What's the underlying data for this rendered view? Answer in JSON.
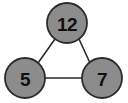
{
  "figure": {
    "background_color": "#ffffff",
    "width": 128,
    "height": 103
  },
  "style": {
    "node_fill": "#8c8c8c",
    "node_stroke": "#2b2b2b",
    "node_stroke_width": 1.8,
    "node_radius": 20,
    "label_color": "#111111",
    "edge_color": "#2b2b2b",
    "edge_width": 1.6
  },
  "chart_data": {
    "type": "diagram",
    "diagram_kind": "node-link-graph",
    "directed": false,
    "title": "",
    "nodes": [
      {
        "id": "top",
        "label": "12",
        "cx": 67,
        "cy": 23,
        "r": 20
      },
      {
        "id": "bottom-left",
        "label": "5",
        "cx": 25,
        "cy": 78,
        "r": 20
      },
      {
        "id": "bottom-right",
        "label": "7",
        "cx": 102,
        "cy": 78,
        "r": 20
      }
    ],
    "edges": [
      {
        "from": "top",
        "to": "bottom-left",
        "x1": 55,
        "y1": 39,
        "x2": 38,
        "y2": 63
      },
      {
        "from": "top",
        "to": "bottom-right",
        "x1": 79,
        "y1": 39,
        "x2": 90,
        "y2": 63
      },
      {
        "from": "bottom-left",
        "to": "bottom-right",
        "x1": 45,
        "y1": 78,
        "x2": 82,
        "y2": 78
      }
    ],
    "legend": [],
    "annotations": []
  }
}
